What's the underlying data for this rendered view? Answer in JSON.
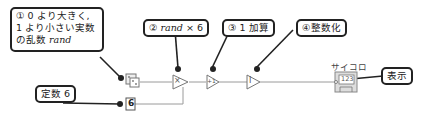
{
  "callouts": {
    "rand": {
      "line1": "① 0 より大きく,",
      "line2": "1 より小さい実数",
      "line3": "の乱数 ",
      "var": "rand"
    },
    "multiply": {
      "prefix": "② ",
      "var": "rand",
      "suffix": " × 6"
    },
    "add_one": {
      "text": "③ 1 加算"
    },
    "to_int": {
      "text": "④整数化"
    },
    "constant": {
      "text": "定数 6"
    },
    "display": {
      "text": "表示"
    }
  },
  "nodes": {
    "random": {
      "icon": "dice-icon"
    },
    "constant_value": "6",
    "multiply_symbol": "×",
    "increment_symbol": "+1",
    "integer_symbol": "I",
    "indicator": {
      "label": "サイコロ",
      "value": "123"
    }
  },
  "colors": {
    "wire": "#9a9a9a",
    "border": "#222222",
    "node": "#777777"
  }
}
